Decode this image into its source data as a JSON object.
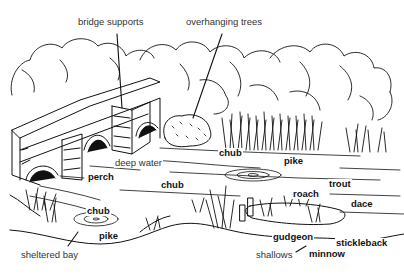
{
  "diagram": {
    "type": "illustrated river habitat scene",
    "colors": {
      "ink": "#111111",
      "background": "#ffffff",
      "feature_label": "#333333"
    },
    "feature_labels": [
      {
        "id": "bridge-supports",
        "text": "bridge supports",
        "x": 77,
        "y": 17
      },
      {
        "id": "overhanging-trees",
        "text": "overhanging trees",
        "x": 185,
        "y": 17
      },
      {
        "id": "deep-water",
        "text": "deep water",
        "x": 114,
        "y": 158
      },
      {
        "id": "sheltered-bay",
        "text": "sheltered bay",
        "x": 20,
        "y": 250
      },
      {
        "id": "shallows",
        "text": "shallows",
        "x": 255,
        "y": 250
      }
    ],
    "fish_labels": [
      {
        "id": "chub-1",
        "text": "chub",
        "x": 218,
        "y": 148
      },
      {
        "id": "pike-1",
        "text": "pike",
        "x": 283,
        "y": 156
      },
      {
        "id": "perch",
        "text": "perch",
        "x": 87,
        "y": 172
      },
      {
        "id": "chub-2",
        "text": "chub",
        "x": 160,
        "y": 180
      },
      {
        "id": "trout",
        "text": "trout",
        "x": 328,
        "y": 179
      },
      {
        "id": "roach",
        "text": "roach",
        "x": 292,
        "y": 189
      },
      {
        "id": "dace",
        "text": "dace",
        "x": 350,
        "y": 199
      },
      {
        "id": "chub-3",
        "text": "chub",
        "x": 86,
        "y": 206
      },
      {
        "id": "pike-2",
        "text": "pike",
        "x": 98,
        "y": 231
      },
      {
        "id": "gudgeon",
        "text": "gudgeon",
        "x": 272,
        "y": 232
      },
      {
        "id": "stickleback",
        "text": "stickleback",
        "x": 335,
        "y": 238
      },
      {
        "id": "minnow",
        "text": "minnow",
        "x": 308,
        "y": 249
      }
    ]
  }
}
